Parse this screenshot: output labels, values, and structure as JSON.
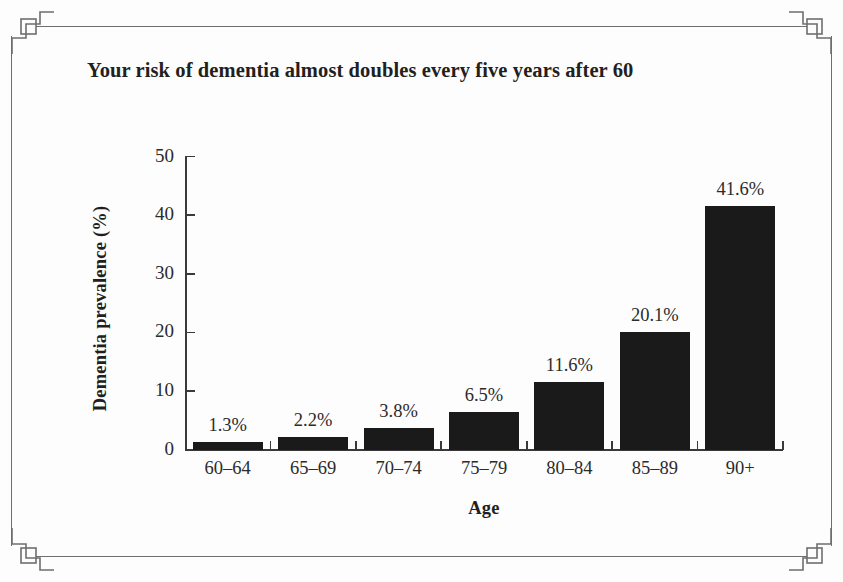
{
  "frame": {
    "ornament": "corner-bracket-ornament",
    "line_color": "#6e6e6e"
  },
  "chart_data": {
    "type": "bar",
    "title": "Your risk of dementia almost doubles every five years after 60",
    "xlabel": "Age",
    "ylabel": "Dementia prevalence (%)",
    "categories": [
      "60–64",
      "65–69",
      "70–74",
      "75–79",
      "80–84",
      "85–89",
      "90+"
    ],
    "values": [
      1.3,
      2.2,
      3.8,
      6.5,
      11.6,
      20.1,
      41.6
    ],
    "value_labels": [
      "1.3%",
      "2.2%",
      "3.8%",
      "6.5%",
      "11.6%",
      "20.1%",
      "41.6%"
    ],
    "ylim": [
      0,
      50
    ],
    "yticks": [
      0,
      10,
      20,
      30,
      40,
      50
    ],
    "ytick_labels": [
      "0",
      "10",
      "20",
      "30",
      "40",
      "50"
    ],
    "grid": false,
    "legend": false,
    "bar_color": "#1a1a1a",
    "background_color": "#fdfdfd"
  }
}
